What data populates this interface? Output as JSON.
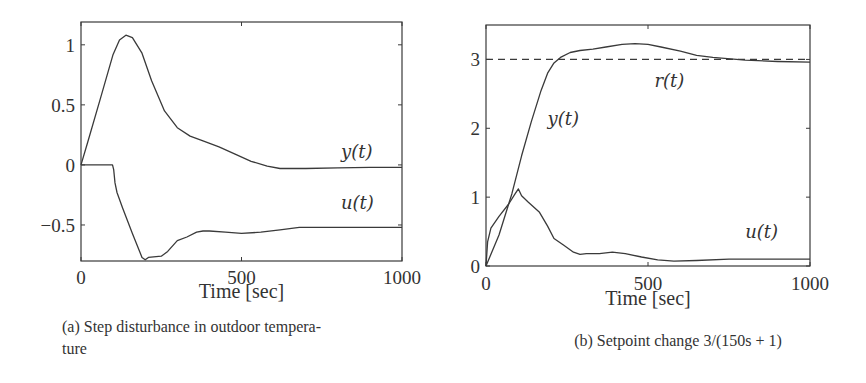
{
  "chart_data": [
    {
      "id": "a",
      "type": "line",
      "title": "",
      "caption": "(a) Step disturbance in outdoor temperature",
      "caption_lines": [
        "(a) Step disturbance in outdoor tempera-",
        "ture"
      ],
      "xlabel": "Time [sec]",
      "ylabel": "",
      "xlim": [
        0,
        1000
      ],
      "ylim": [
        -0.8,
        1.19
      ],
      "xticks": [
        0,
        500,
        1000
      ],
      "xtick_labels": [
        "0",
        "500",
        "1000"
      ],
      "yticks": [
        -0.5,
        0,
        0.5,
        1
      ],
      "ytick_labels": [
        "−0.5",
        "0",
        "0.5",
        "1"
      ],
      "grid": false,
      "legend": "inline labels",
      "series": [
        {
          "name": "y(t)",
          "label": "y(t)",
          "style": "solid",
          "x": [
            0,
            20,
            60,
            100,
            120,
            140,
            160,
            190,
            220,
            260,
            300,
            340,
            380,
            430,
            480,
            530,
            580,
            620,
            700,
            800,
            900,
            1000
          ],
          "values": [
            0,
            0.18,
            0.55,
            0.92,
            1.04,
            1.08,
            1.06,
            0.93,
            0.7,
            0.45,
            0.31,
            0.24,
            0.2,
            0.15,
            0.09,
            0.03,
            -0.01,
            -0.03,
            -0.03,
            -0.025,
            -0.02,
            -0.02
          ]
        },
        {
          "name": "u(t)",
          "label": "u(t)",
          "style": "solid",
          "x": [
            0,
            98,
            102,
            106,
            112,
            130,
            160,
            190,
            200,
            210,
            250,
            270,
            300,
            330,
            360,
            380,
            400,
            450,
            500,
            560,
            620,
            680,
            750,
            850,
            1000
          ],
          "values": [
            0,
            0,
            -0.04,
            -0.15,
            -0.23,
            -0.36,
            -0.57,
            -0.77,
            -0.79,
            -0.77,
            -0.76,
            -0.72,
            -0.63,
            -0.6,
            -0.56,
            -0.55,
            -0.55,
            -0.56,
            -0.57,
            -0.56,
            -0.54,
            -0.52,
            -0.52,
            -0.52,
            -0.52
          ]
        }
      ],
      "annotations": [
        {
          "text": "y(t)",
          "x": 810,
          "y": 0.06
        },
        {
          "text": "u(t)",
          "x": 810,
          "y": -0.37
        }
      ]
    },
    {
      "id": "b",
      "type": "line",
      "title": "",
      "caption": "(b) Setpoint change 3/(150s + 1)",
      "xlabel": "Time [sec]",
      "ylabel": "",
      "xlim": [
        0,
        1000
      ],
      "ylim": [
        0,
        3.5
      ],
      "xticks": [
        0,
        500,
        1000
      ],
      "xtick_labels": [
        "0",
        "500",
        "1000"
      ],
      "yticks": [
        0,
        1,
        2,
        3
      ],
      "ytick_labels": [
        "0",
        "1",
        "2",
        "3"
      ],
      "grid": false,
      "legend": "inline labels",
      "series": [
        {
          "name": "y(t)",
          "label": "y(t)",
          "style": "solid",
          "x": [
            0,
            40,
            80,
            110,
            140,
            170,
            190,
            210,
            230,
            260,
            290,
            330,
            370,
            420,
            460,
            500,
            540,
            600,
            650,
            700,
            800,
            900,
            1000
          ],
          "values": [
            0,
            0.45,
            1.05,
            1.6,
            2.1,
            2.55,
            2.8,
            2.95,
            3.03,
            3.1,
            3.13,
            3.15,
            3.18,
            3.22,
            3.23,
            3.22,
            3.18,
            3.12,
            3.06,
            3.03,
            2.99,
            2.97,
            2.96
          ]
        },
        {
          "name": "u(t)",
          "label": "u(t)",
          "style": "solid",
          "x": [
            0,
            5,
            15,
            40,
            70,
            90,
            100,
            110,
            130,
            165,
            190,
            210,
            240,
            270,
            290,
            310,
            350,
            390,
            430,
            480,
            530,
            580,
            650,
            750,
            850,
            1000
          ],
          "values": [
            0,
            0.35,
            0.55,
            0.72,
            0.9,
            1.05,
            1.12,
            1.02,
            0.93,
            0.78,
            0.58,
            0.4,
            0.3,
            0.2,
            0.17,
            0.18,
            0.18,
            0.2,
            0.18,
            0.13,
            0.09,
            0.07,
            0.08,
            0.1,
            0.1,
            0.1
          ]
        },
        {
          "name": "r(t)",
          "label": "r(t)",
          "style": "dashed",
          "x": [
            0,
            1000
          ],
          "values": [
            3,
            3
          ]
        }
      ],
      "annotations": [
        {
          "text": "r(t)",
          "x": 520,
          "y": 2.6
        },
        {
          "text": "y(t)",
          "x": 190,
          "y": 2.05
        },
        {
          "text": "u(t)",
          "x": 800,
          "y": 0.4
        }
      ]
    }
  ]
}
